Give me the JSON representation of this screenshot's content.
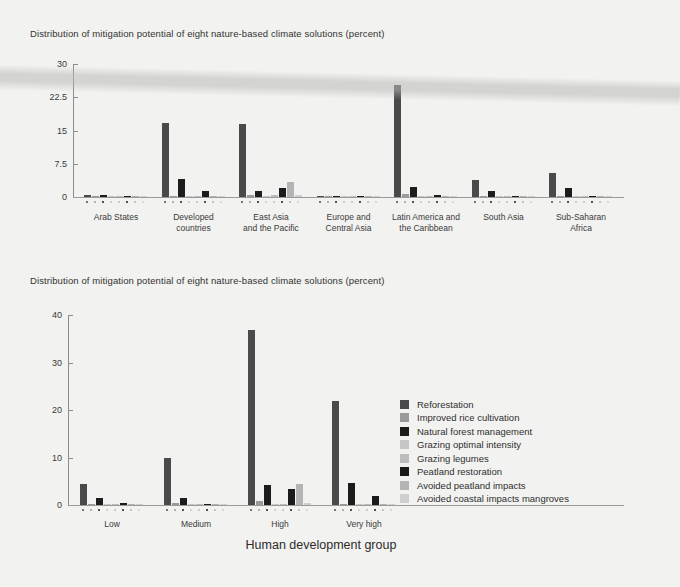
{
  "page": {
    "background": "#f2f2f0",
    "artifact": "diagonal-scan-band"
  },
  "legend": {
    "items": [
      {
        "label": "Reforestation",
        "color": "#4a4a4a"
      },
      {
        "label": "Improved rice cultivation",
        "color": "#9a9a9a"
      },
      {
        "label": "Natural forest management",
        "color": "#1c1c1c"
      },
      {
        "label": "Grazing optimal intensity",
        "color": "#c6c6c6"
      },
      {
        "label": "Grazing legumes",
        "color": "#bdbdbd"
      },
      {
        "label": "Peatland restoration",
        "color": "#1a1a1a"
      },
      {
        "label": "Avoided peatland impacts",
        "color": "#b4b4b4"
      },
      {
        "label": "Avoided coastal impacts mangroves",
        "color": "#cfcfcf"
      }
    ]
  },
  "chart_data": [
    {
      "id": "chart-regions",
      "type": "bar",
      "title": "Distribution of mitigation potential of eight nature-based climate solutions (percent)",
      "xlabel": "",
      "ylabel": "",
      "ylim": [
        0,
        30
      ],
      "yticks": [
        0,
        7.5,
        15,
        22.5,
        30
      ],
      "ytick_labels": [
        "0",
        "7.5",
        "15",
        "22.5",
        "30"
      ],
      "grid": false,
      "legend_position": "none",
      "categories": [
        "Arab States",
        "Developed\ncountries",
        "East Asia\nand the Pacific",
        "Europe and\nCentral Asia",
        "Latin America and\nthe Caribbean",
        "South Asia",
        "Sub-Saharan\nAfrica"
      ],
      "series": [
        {
          "name": "Reforestation",
          "color": "#4a4a4a",
          "values": [
            0.4,
            16.7,
            16.5,
            0.2,
            25.2,
            3.9,
            5.5
          ]
        },
        {
          "name": "Improved rice cultivation",
          "color": "#9a9a9a",
          "values": [
            0.05,
            0.2,
            0.5,
            0.05,
            0.6,
            0.1,
            0.2
          ]
        },
        {
          "name": "Natural forest management",
          "color": "#1c1c1c",
          "values": [
            0.4,
            4.1,
            1.3,
            0.1,
            2.2,
            1.3,
            2.0
          ]
        },
        {
          "name": "Grazing optimal intensity",
          "color": "#c6c6c6",
          "values": [
            0.1,
            0.1,
            0.2,
            0.05,
            0.2,
            0.1,
            0.2
          ]
        },
        {
          "name": "Grazing legumes",
          "color": "#bdbdbd",
          "values": [
            0.1,
            0.1,
            0.5,
            0.05,
            0.2,
            0.1,
            0.1
          ]
        },
        {
          "name": "Peatland restoration",
          "color": "#1a1a1a",
          "values": [
            0.3,
            1.3,
            2.1,
            0.1,
            0.4,
            0.2,
            0.2
          ]
        },
        {
          "name": "Avoided peatland impacts",
          "color": "#b4b4b4",
          "values": [
            0.1,
            0.1,
            3.3,
            0.05,
            0.3,
            0.1,
            0.1
          ]
        },
        {
          "name": "Avoided coastal impacts mangroves",
          "color": "#cfcfcf",
          "values": [
            0.1,
            0.1,
            0.4,
            0.05,
            0.2,
            0.1,
            0.1
          ]
        }
      ]
    },
    {
      "id": "chart-hdi",
      "type": "bar",
      "title": "Distribution of mitigation potential of eight nature-based climate solutions (percent)",
      "xlabel": "Human development group",
      "ylabel": "",
      "ylim": [
        0,
        40
      ],
      "yticks": [
        0,
        10,
        20,
        30,
        40
      ],
      "ytick_labels": [
        "0",
        "10",
        "20",
        "30",
        "40"
      ],
      "grid": false,
      "legend_position": "right",
      "categories": [
        "Low",
        "Medium",
        "High",
        "Very high"
      ],
      "series": [
        {
          "name": "Reforestation",
          "color": "#4a4a4a",
          "values": [
            4.4,
            9.9,
            36.8,
            21.8
          ]
        },
        {
          "name": "Improved rice cultivation",
          "color": "#9a9a9a",
          "values": [
            0.2,
            0.5,
            0.9,
            0.3
          ]
        },
        {
          "name": "Natural forest management",
          "color": "#1c1c1c",
          "values": [
            1.5,
            1.4,
            4.2,
            4.6
          ]
        },
        {
          "name": "Grazing optimal intensity",
          "color": "#c6c6c6",
          "values": [
            0.2,
            0.2,
            0.3,
            0.2
          ]
        },
        {
          "name": "Grazing legumes",
          "color": "#bdbdbd",
          "values": [
            0.2,
            0.2,
            0.3,
            0.2
          ]
        },
        {
          "name": "Peatland restoration",
          "color": "#1a1a1a",
          "values": [
            0.5,
            0.3,
            3.3,
            1.8
          ]
        },
        {
          "name": "Avoided peatland impacts",
          "color": "#b4b4b4",
          "values": [
            0.2,
            0.2,
            4.4,
            0.3
          ]
        },
        {
          "name": "Avoided coastal impacts mangroves",
          "color": "#cfcfcf",
          "values": [
            0.2,
            0.2,
            0.4,
            0.2
          ]
        }
      ]
    }
  ]
}
